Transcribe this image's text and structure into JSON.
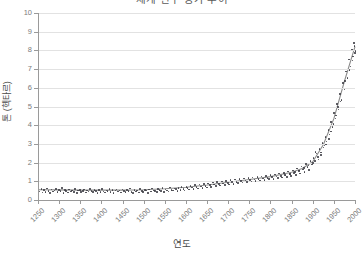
{
  "chart": {
    "title": "세계 인구 증가 추이",
    "xlabel": "연도",
    "ylabel": "톤 (헥타르)"
  },
  "chart_data": {
    "type": "scatter",
    "title": "세계 인구 증가 추이",
    "xlabel": "연도",
    "ylabel": "톤 (헥타르)",
    "xlim": [
      1250,
      2000
    ],
    "ylim": [
      0,
      10
    ],
    "grid": true,
    "legend": "none",
    "xticks": [
      1250,
      1300,
      1350,
      1400,
      1450,
      1500,
      1550,
      1600,
      1650,
      1700,
      1750,
      1800,
      1850,
      1900,
      1950,
      2000
    ],
    "yticks": [
      0,
      1,
      2,
      3,
      4,
      5,
      6,
      7,
      8,
      9,
      10
    ],
    "series": [
      {
        "name": "관측치",
        "type": "scatter",
        "marker": "dot",
        "color": "#3f3f46",
        "points": [
          [
            1252,
            0.5
          ],
          [
            1256,
            0.62
          ],
          [
            1259,
            0.44
          ],
          [
            1263,
            0.58
          ],
          [
            1266,
            0.47
          ],
          [
            1270,
            0.66
          ],
          [
            1273,
            0.52
          ],
          [
            1277,
            0.41
          ],
          [
            1280,
            0.6
          ],
          [
            1284,
            0.49
          ],
          [
            1287,
            0.55
          ],
          [
            1291,
            0.63
          ],
          [
            1294,
            0.46
          ],
          [
            1298,
            0.57
          ],
          [
            1301,
            0.51
          ],
          [
            1305,
            0.68
          ],
          [
            1308,
            0.43
          ],
          [
            1312,
            0.59
          ],
          [
            1315,
            0.53
          ],
          [
            1319,
            0.45
          ],
          [
            1322,
            0.61
          ],
          [
            1326,
            0.5
          ],
          [
            1329,
            0.56
          ],
          [
            1333,
            0.48
          ],
          [
            1336,
            0.64
          ],
          [
            1340,
            0.42
          ],
          [
            1343,
            0.54
          ],
          [
            1347,
            0.58
          ],
          [
            1350,
            0.47
          ],
          [
            1354,
            0.52
          ],
          [
            1357,
            0.6
          ],
          [
            1361,
            0.44
          ],
          [
            1364,
            0.55
          ],
          [
            1368,
            0.49
          ],
          [
            1371,
            0.63
          ],
          [
            1375,
            0.51
          ],
          [
            1378,
            0.46
          ],
          [
            1382,
            0.57
          ],
          [
            1385,
            0.53
          ],
          [
            1389,
            0.43
          ],
          [
            1392,
            0.59
          ],
          [
            1396,
            0.48
          ],
          [
            1399,
            0.62
          ],
          [
            1403,
            0.5
          ],
          [
            1406,
            0.45
          ],
          [
            1410,
            0.56
          ],
          [
            1413,
            0.52
          ],
          [
            1417,
            0.64
          ],
          [
            1420,
            0.47
          ],
          [
            1424,
            0.58
          ],
          [
            1427,
            0.41
          ],
          [
            1431,
            0.54
          ],
          [
            1434,
            0.6
          ],
          [
            1438,
            0.49
          ],
          [
            1441,
            0.55
          ],
          [
            1445,
            0.44
          ],
          [
            1448,
            0.61
          ],
          [
            1452,
            0.51
          ],
          [
            1455,
            0.46
          ],
          [
            1459,
            0.57
          ],
          [
            1462,
            0.53
          ],
          [
            1466,
            0.65
          ],
          [
            1469,
            0.48
          ],
          [
            1473,
            0.42
          ],
          [
            1476,
            0.59
          ],
          [
            1480,
            0.5
          ],
          [
            1483,
            0.56
          ],
          [
            1487,
            0.45
          ],
          [
            1490,
            0.62
          ],
          [
            1494,
            0.52
          ],
          [
            1497,
            0.47
          ],
          [
            1501,
            0.58
          ],
          [
            1504,
            0.54
          ],
          [
            1508,
            0.43
          ],
          [
            1511,
            0.6
          ],
          [
            1515,
            0.49
          ],
          [
            1518,
            0.66
          ],
          [
            1522,
            0.55
          ],
          [
            1525,
            0.51
          ],
          [
            1529,
            0.46
          ],
          [
            1532,
            0.63
          ],
          [
            1536,
            0.57
          ],
          [
            1539,
            0.52
          ],
          [
            1543,
            0.68
          ],
          [
            1546,
            0.48
          ],
          [
            1550,
            0.61
          ],
          [
            1553,
            0.56
          ],
          [
            1557,
            0.5
          ],
          [
            1560,
            0.72
          ],
          [
            1564,
            0.59
          ],
          [
            1567,
            0.54
          ],
          [
            1571,
            0.66
          ],
          [
            1574,
            0.62
          ],
          [
            1578,
            0.51
          ],
          [
            1581,
            0.7
          ],
          [
            1585,
            0.58
          ],
          [
            1588,
            0.75
          ],
          [
            1592,
            0.63
          ],
          [
            1595,
            0.55
          ],
          [
            1599,
            0.74
          ],
          [
            1602,
            0.68
          ],
          [
            1606,
            0.6
          ],
          [
            1609,
            0.79
          ],
          [
            1613,
            0.71
          ],
          [
            1616,
            0.64
          ],
          [
            1620,
            0.83
          ],
          [
            1623,
            0.73
          ],
          [
            1627,
            0.66
          ],
          [
            1630,
            0.87
          ],
          [
            1634,
            0.76
          ],
          [
            1637,
            0.69
          ],
          [
            1641,
            0.9
          ],
          [
            1644,
            0.8
          ],
          [
            1648,
            0.72
          ],
          [
            1651,
            0.93
          ],
          [
            1655,
            0.84
          ],
          [
            1658,
            0.75
          ],
          [
            1662,
            0.97
          ],
          [
            1665,
            0.87
          ],
          [
            1669,
            0.78
          ],
          [
            1672,
            1.0
          ],
          [
            1676,
            0.9
          ],
          [
            1679,
            0.82
          ],
          [
            1683,
            1.04
          ],
          [
            1686,
            0.93
          ],
          [
            1690,
            0.85
          ],
          [
            1693,
            1.07
          ],
          [
            1697,
            0.96
          ],
          [
            1700,
            0.88
          ],
          [
            1704,
            1.1
          ],
          [
            1707,
            0.99
          ],
          [
            1711,
            0.91
          ],
          [
            1714,
            1.13
          ],
          [
            1718,
            1.02
          ],
          [
            1721,
            0.94
          ],
          [
            1725,
            1.16
          ],
          [
            1728,
            1.05
          ],
          [
            1732,
            0.97
          ],
          [
            1735,
            1.19
          ],
          [
            1739,
            1.08
          ],
          [
            1742,
            1.0
          ],
          [
            1746,
            1.22
          ],
          [
            1749,
            1.11
          ],
          [
            1753,
            1.03
          ],
          [
            1756,
            1.25
          ],
          [
            1760,
            1.14
          ],
          [
            1763,
            1.06
          ],
          [
            1767,
            1.28
          ],
          [
            1770,
            1.17
          ],
          [
            1774,
            1.09
          ],
          [
            1777,
            1.31
          ],
          [
            1781,
            1.2
          ],
          [
            1784,
            1.12
          ],
          [
            1788,
            1.34
          ],
          [
            1791,
            1.23
          ],
          [
            1795,
            1.15
          ],
          [
            1798,
            1.37
          ],
          [
            1802,
            1.26
          ],
          [
            1805,
            1.18
          ],
          [
            1809,
            1.41
          ],
          [
            1812,
            1.29
          ],
          [
            1816,
            1.21
          ],
          [
            1819,
            1.45
          ],
          [
            1823,
            1.33
          ],
          [
            1826,
            1.24
          ],
          [
            1830,
            1.5
          ],
          [
            1833,
            1.38
          ],
          [
            1837,
            1.28
          ],
          [
            1840,
            1.56
          ],
          [
            1844,
            1.44
          ],
          [
            1847,
            1.33
          ],
          [
            1851,
            1.63
          ],
          [
            1854,
            1.5
          ],
          [
            1858,
            1.39
          ],
          [
            1861,
            1.72
          ],
          [
            1865,
            1.58
          ],
          [
            1868,
            1.46
          ],
          [
            1872,
            1.83
          ],
          [
            1875,
            1.68
          ],
          [
            1879,
            1.55
          ],
          [
            1882,
            1.96
          ],
          [
            1886,
            1.8
          ],
          [
            1889,
            1.66
          ],
          [
            1893,
            2.12
          ],
          [
            1896,
            1.95
          ],
          [
            1900,
            2.3
          ],
          [
            1903,
            2.12
          ],
          [
            1907,
            2.52
          ],
          [
            1910,
            2.33
          ],
          [
            1914,
            2.78
          ],
          [
            1917,
            2.58
          ],
          [
            1921,
            3.08
          ],
          [
            1924,
            2.86
          ],
          [
            1928,
            3.42
          ],
          [
            1931,
            3.18
          ],
          [
            1935,
            3.8
          ],
          [
            1938,
            3.55
          ],
          [
            1942,
            4.22
          ],
          [
            1945,
            3.96
          ],
          [
            1949,
            4.68
          ],
          [
            1952,
            4.4
          ],
          [
            1956,
            5.18
          ],
          [
            1959,
            4.88
          ],
          [
            1963,
            5.72
          ],
          [
            1966,
            5.4
          ],
          [
            1970,
            6.3
          ],
          [
            1973,
            5.96
          ],
          [
            1977,
            6.92
          ],
          [
            1980,
            6.56
          ],
          [
            1984,
            7.56
          ],
          [
            1987,
            7.18
          ],
          [
            1991,
            8.1
          ],
          [
            1994,
            7.72
          ],
          [
            1997,
            8.28
          ],
          [
            1999,
            8.02
          ],
          [
            1905,
            2.62
          ],
          [
            1918,
            2.44
          ],
          [
            1930,
            3.02
          ],
          [
            1941,
            3.7
          ],
          [
            1953,
            4.56
          ],
          [
            1964,
            5.3
          ],
          [
            1975,
            6.4
          ],
          [
            1985,
            7.0
          ],
          [
            1992,
            7.5
          ],
          [
            1996,
            8.45
          ],
          [
            1998,
            7.9
          ],
          [
            1958,
            5.02
          ],
          [
            1947,
            4.1
          ],
          [
            1937,
            3.32
          ],
          [
            1926,
            2.96
          ],
          [
            1912,
            2.2
          ],
          [
            1899,
            2.02
          ],
          [
            1888,
            1.88
          ],
          [
            1877,
            1.74
          ],
          [
            1866,
            1.62
          ],
          [
            1856,
            1.54
          ],
          [
            1845,
            1.42
          ],
          [
            1834,
            1.36
          ]
        ]
      },
      {
        "name": "추세선",
        "type": "line",
        "color": "#8c8c8c",
        "points": [
          [
            1250,
            0.55
          ],
          [
            1300,
            0.54
          ],
          [
            1350,
            0.53
          ],
          [
            1400,
            0.53
          ],
          [
            1450,
            0.53
          ],
          [
            1500,
            0.55
          ],
          [
            1550,
            0.6
          ],
          [
            1600,
            0.68
          ],
          [
            1650,
            0.8
          ],
          [
            1700,
            0.95
          ],
          [
            1750,
            1.1
          ],
          [
            1800,
            1.25
          ],
          [
            1850,
            1.48
          ],
          [
            1875,
            1.68
          ],
          [
            1900,
            2.05
          ],
          [
            1925,
            2.95
          ],
          [
            1950,
            4.35
          ],
          [
            1975,
            6.35
          ],
          [
            2000,
            8.2
          ]
        ]
      }
    ]
  }
}
